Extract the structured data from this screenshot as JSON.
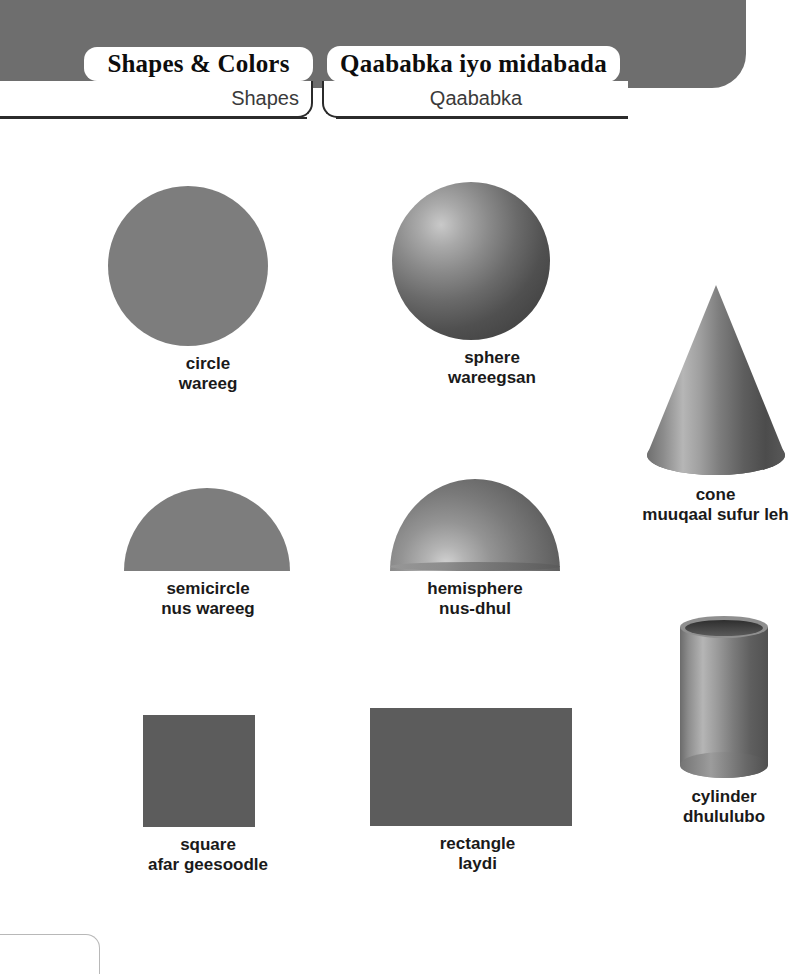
{
  "header": {
    "band_color": "#6e6e6e",
    "tabs": [
      {
        "id": "shapes-colors",
        "title": "Shapes & Colors",
        "subtitle": "Shapes"
      },
      {
        "id": "qaababka",
        "title": "Qaababka iyo midabada",
        "subtitle": "Qaababka"
      }
    ]
  },
  "colors": {
    "flat_shape": "#7d7d7d",
    "solid_shape": "#5c5c5c",
    "header_band": "#6e6e6e",
    "label_text": "#1a1a1a",
    "page_background": "#ffffff"
  },
  "shapes": [
    {
      "id": "circle",
      "name_en": "circle",
      "name_so": "wareeg",
      "render": "flat-circle"
    },
    {
      "id": "sphere",
      "name_en": "sphere",
      "name_so": "wareegsan",
      "render": "shaded-sphere"
    },
    {
      "id": "cone",
      "name_en": "cone",
      "name_so": "muuqaal sufur leh",
      "render": "shaded-cone"
    },
    {
      "id": "semicircle",
      "name_en": "semicircle",
      "name_so": "nus wareeg",
      "render": "flat-semicircle"
    },
    {
      "id": "hemisphere",
      "name_en": "hemisphere",
      "name_so": "nus-dhul",
      "render": "shaded-hemisphere"
    },
    {
      "id": "cylinder",
      "name_en": "cylinder",
      "name_so": "dhululubo",
      "render": "shaded-cylinder"
    },
    {
      "id": "square",
      "name_en": "square",
      "name_so": "afar geesoodle",
      "render": "flat-square"
    },
    {
      "id": "rectangle",
      "name_en": "rectangle",
      "name_so": "laydi",
      "render": "flat-rectangle"
    }
  ]
}
